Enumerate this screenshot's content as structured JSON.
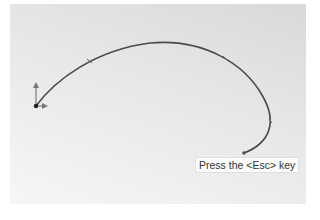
{
  "viewport": {
    "background_gradient": [
      "#d9d9d9",
      "#f6f6f6"
    ]
  },
  "sketch": {
    "entity": "spline",
    "stroke_color": "#4a4a4a",
    "start_point": [
      36,
      106
    ],
    "end_point": [
      244,
      153
    ],
    "origin_icon": "coordinate-axes-icon"
  },
  "tooltip": {
    "text": "Press the <Esc> key"
  }
}
